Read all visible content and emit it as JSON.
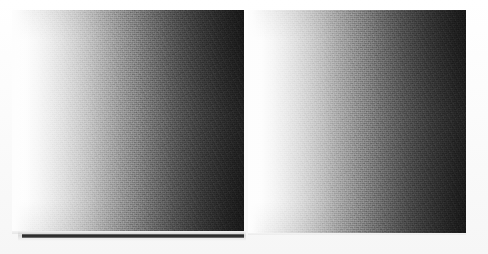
{
  "image": {
    "title": "Grayscale gradient test pair",
    "description": "Two side-by-side horizontal grayscale ramps on a white page, scanned with visible print grain. A thin dark horizontal rule runs beneath the left ramp.",
    "width": 488,
    "height": 254,
    "background_color": "#fdfdfd",
    "rendering": "halftone-scan"
  },
  "panels": [
    {
      "id": "left-ramp",
      "label": "Left gradient panel",
      "x": 12,
      "y": 10,
      "width": 232,
      "height": 222,
      "direction": "left-to-right",
      "start_color": "#ffffff",
      "end_color": "#181818",
      "has_under_rule": true
    },
    {
      "id": "right-ramp",
      "label": "Right gradient panel",
      "x": 248,
      "y": 10,
      "width": 218,
      "height": 223,
      "direction": "left-to-right",
      "start_color": "#ffffff",
      "end_color": "#181818",
      "has_under_rule": false
    }
  ],
  "under_rule": {
    "id": "left-under-rule",
    "label": "Dark horizontal rule beneath left panel",
    "x": 22,
    "y": 234,
    "width": 222,
    "height": 4,
    "color": "#1f1f1f"
  },
  "chart_data": {
    "type": "heatmap",
    "xlabel": "",
    "ylabel": "",
    "colormap": "gray",
    "legend": "none",
    "grid": false,
    "x": [
      0,
      10,
      20,
      30,
      40,
      50,
      60,
      70,
      80,
      90,
      100
    ],
    "series": [
      {
        "name": "Left gradient panel",
        "values": [
          100,
          96,
          88,
          78,
          67,
          56,
          46,
          36,
          27,
          18,
          10
        ]
      },
      {
        "name": "Right gradient panel",
        "values": [
          100,
          96,
          88,
          78,
          67,
          56,
          46,
          36,
          27,
          18,
          10
        ]
      }
    ],
    "ylim": [
      0,
      100
    ],
    "xlim": [
      0,
      100
    ],
    "annotations": [
      "Luminance percent, 100 = white, 0 = black",
      "Both panels share an identical white-to-black horizontal ramp"
    ]
  }
}
